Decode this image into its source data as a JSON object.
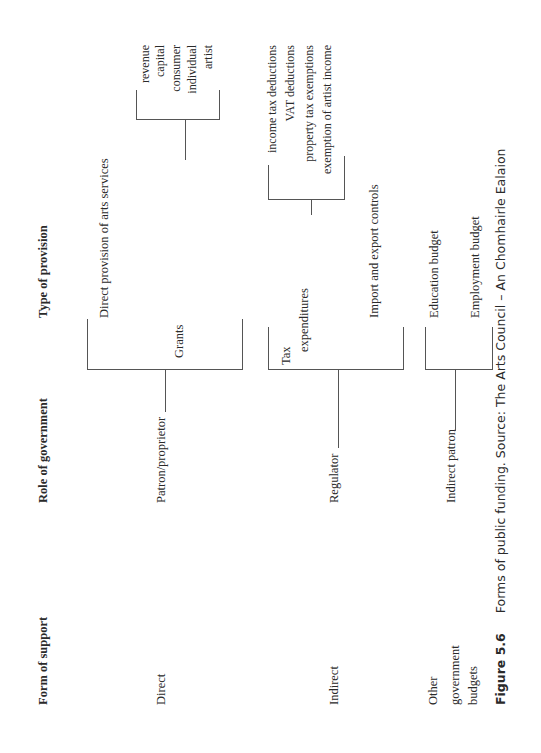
{
  "figure": {
    "label": "Figure 5.6",
    "caption": "Forms of public funding. Source: The Arts Council – An Chomhairle Ealaion"
  },
  "columns": {
    "form_of_support": "Form of support",
    "role_of_government": "Role of government",
    "type_of_provision": "Type of provision"
  },
  "rows": [
    {
      "form": "Direct",
      "role": "Patron/proprietor",
      "provisions": [
        {
          "label": "Direct provision of arts services"
        },
        {
          "label": "Grants",
          "sub": [
            "revenue",
            "capital",
            "consumer",
            "individual",
            "artist"
          ]
        }
      ]
    },
    {
      "form": "Indirect",
      "role": "Regulator",
      "provisions": [
        {
          "label_line1": "Tax",
          "label_line2": "expenditures",
          "sub": [
            "income tax deductions",
            "VAT deductions",
            "property tax exemptions",
            "exemption of artist income"
          ]
        },
        {
          "label": "Import and export controls"
        }
      ]
    },
    {
      "form_lines": [
        "Other",
        "government",
        "budgets"
      ],
      "role": "Indirect patron",
      "provisions": [
        {
          "label": "Education budget"
        },
        {
          "label": "Employment budget"
        }
      ]
    }
  ]
}
